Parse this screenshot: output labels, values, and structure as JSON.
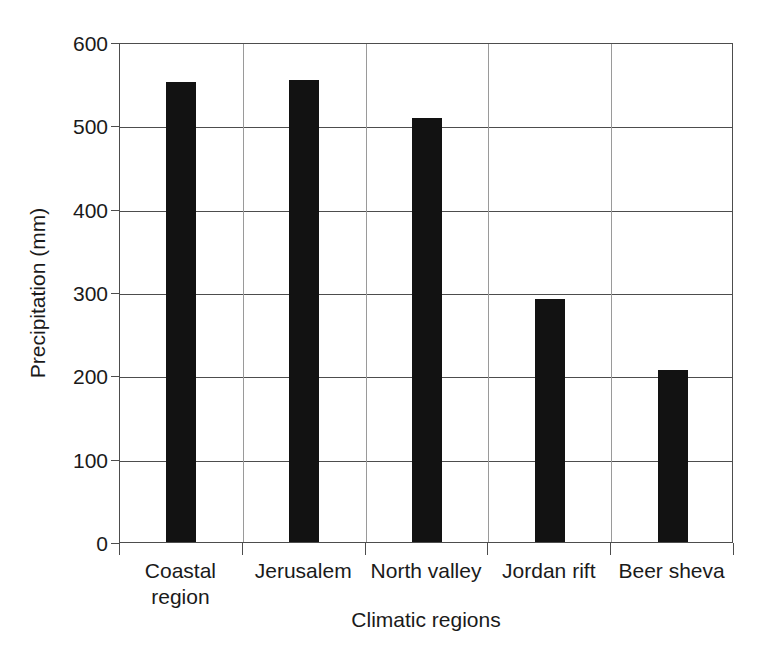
{
  "chart_data": {
    "type": "bar",
    "title": "",
    "xlabel": "Climatic regions",
    "ylabel": "Precipitation (mm)",
    "categories": [
      "Coastal\nregion",
      "Jerusalem",
      "North valley",
      "Jordan rift",
      "Beer sheva"
    ],
    "values": [
      552,
      555,
      509,
      292,
      206
    ],
    "ylim": [
      0,
      600
    ],
    "yticks": [
      0,
      100,
      200,
      300,
      400,
      500,
      600
    ],
    "ytick_labels": [
      "0",
      "100",
      "200",
      "300",
      "400",
      "500",
      "600"
    ],
    "grid": "horizontal",
    "legend": "none",
    "bar_color": "#121212",
    "axis_color": "#4d4d4d",
    "background_color": "#ffffff"
  }
}
